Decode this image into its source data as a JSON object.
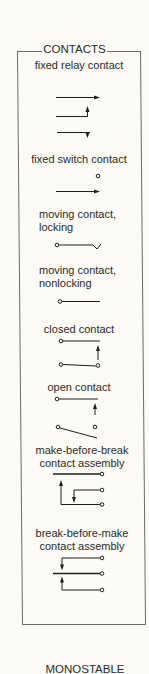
{
  "section_title": "CONTACTS",
  "symbols": [
    {
      "id": "fixed-relay-contact",
      "label": "fixed relay contact"
    },
    {
      "id": "fixed-switch-contact",
      "label": "fixed switch contact"
    },
    {
      "id": "moving-contact-locking",
      "label_line1": "moving contact,",
      "label_line2": "locking"
    },
    {
      "id": "moving-contact-nonlocking",
      "label_line1": "moving contact,",
      "label_line2": "nonlocking"
    },
    {
      "id": "closed-contact",
      "label": "closed contact"
    },
    {
      "id": "open-contact",
      "label": "open contact"
    },
    {
      "id": "make-before-break",
      "label_line1": "make-before-break",
      "label_line2": "contact assembly"
    },
    {
      "id": "break-before-make",
      "label_line1": "break-before-make",
      "label_line2": "contact assembly"
    }
  ],
  "footer_heading": "MONOSTABLE",
  "colors": {
    "line": "#1e1e1e",
    "border": "#6a6a6a",
    "background": "#fbfaf5"
  }
}
